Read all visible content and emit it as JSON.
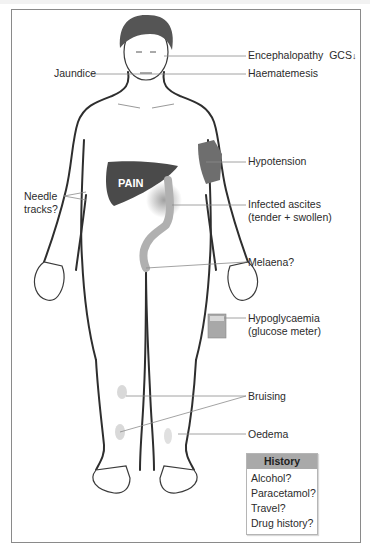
{
  "labels": {
    "encephalopathy": "Encephalopathy",
    "gcs": "GCS",
    "gcs_arrow": "down-arrow",
    "jaundice": "Jaundice",
    "haematemesis": "Haematemesis",
    "hypotension": "Hypotension",
    "needle_tracks": [
      "Needle",
      "tracks?"
    ],
    "infected_ascites": [
      "Infected ascites",
      "(tender + swollen)"
    ],
    "pain": "PAIN",
    "melaena": "Melaena?",
    "hypoglycaemia": [
      "Hypoglycaemia",
      "(glucose meter)"
    ],
    "bruising": "Bruising",
    "oedema": "Oedema"
  },
  "history": {
    "title": "History",
    "items": [
      "Alcohol?",
      "Paracetamol?",
      "Travel?",
      "Drug history?"
    ]
  },
  "colors": {
    "outline": "#2e2e2e",
    "liver": "#4a4a4a",
    "cuff": "#6e6e6e",
    "bowel": "#b0b0b0",
    "leader": "#8c8c8c",
    "history_header": "#a9a9a9"
  },
  "icons": [
    "blood-pressure-cuff",
    "glucose-meter",
    "liver",
    "bowel",
    "gcs-down-arrow"
  ]
}
